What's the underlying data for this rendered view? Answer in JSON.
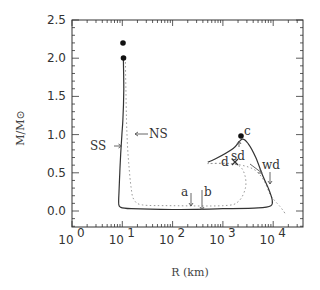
{
  "chart_data": {
    "type": "line",
    "title": "",
    "xlabel": "R (km)",
    "ylabel": "M/M⊙",
    "xscale": "log",
    "xlim": [
      1,
      40000
    ],
    "ylim": [
      -0.2,
      2.5
    ],
    "x_ticks": [
      {
        "value": 1,
        "base": "10",
        "exp": "0"
      },
      {
        "value": 10,
        "base": "10",
        "exp": "1"
      },
      {
        "value": 100,
        "base": "10",
        "exp": "2"
      },
      {
        "value": 1000,
        "base": "10",
        "exp": "3"
      },
      {
        "value": 10000,
        "base": "10",
        "exp": "4"
      }
    ],
    "y_ticks": [
      "0.0",
      "0.5",
      "1.0",
      "1.5",
      "2.0",
      "2.5"
    ],
    "grid": false,
    "legend": null,
    "series": [
      {
        "name": "SS",
        "style": "solid",
        "points": [
          [
            10.5,
            2.0
          ],
          [
            10.7,
            1.6
          ],
          [
            10.3,
            1.2
          ],
          [
            9.8,
            1.0
          ],
          [
            9.3,
            0.75
          ],
          [
            8.9,
            0.5
          ],
          [
            8.6,
            0.25
          ],
          [
            8.5,
            0.1
          ],
          [
            9.2,
            0.05
          ],
          [
            15,
            0.03
          ],
          [
            100,
            0.02
          ],
          [
            1000,
            0.03
          ],
          [
            5000,
            0.04
          ],
          [
            9000,
            0.07
          ],
          [
            9500,
            0.15
          ],
          [
            8000,
            0.3
          ],
          [
            6300,
            0.45
          ],
          [
            4500,
            0.7
          ],
          [
            3200,
            0.88
          ],
          [
            2400,
            0.94
          ],
          [
            1600,
            0.82
          ],
          [
            700,
            0.68
          ],
          [
            500,
            0.64
          ]
        ]
      },
      {
        "name": "NS",
        "style": "dotted",
        "points": [
          [
            11.5,
            2.0
          ],
          [
            11.8,
            1.6
          ],
          [
            12.1,
            1.2
          ],
          [
            12.6,
            0.9
          ],
          [
            13.5,
            0.6
          ],
          [
            15,
            0.3
          ],
          [
            17,
            0.15
          ],
          [
            25,
            0.08
          ],
          [
            100,
            0.07
          ],
          [
            1000,
            0.07
          ],
          [
            2000,
            0.12
          ],
          [
            2800,
            0.3
          ],
          [
            2700,
            0.48
          ],
          [
            2000,
            0.6
          ],
          [
            1000,
            0.62
          ],
          [
            500,
            0.62
          ],
          [
            1500,
            0.62
          ],
          [
            4000,
            0.55
          ],
          [
            6500,
            0.4
          ],
          [
            9000,
            0.2
          ],
          [
            14000,
            0.05
          ],
          [
            18000,
            -0.05
          ]
        ]
      }
    ],
    "markers": [
      {
        "label": "",
        "R": 10.5,
        "M": 2.2,
        "shape": "filled-circle"
      },
      {
        "label": "",
        "R": 10.8,
        "M": 2.0,
        "shape": "filled-circle"
      },
      {
        "label": "c",
        "R": 2300,
        "M": 0.97,
        "shape": "filled-circle"
      },
      {
        "label": "d",
        "R": 500,
        "M": 0.64,
        "shape": "cross"
      }
    ],
    "annotations": [
      {
        "text": "SS",
        "points_to": "SS curve at M≈0.78",
        "arrow": "right"
      },
      {
        "text": "NS",
        "points_to": "NS curve at M≈1.0",
        "arrow": "left"
      },
      {
        "text": "a",
        "R": 300,
        "arrow": "down"
      },
      {
        "text": "b",
        "R": 450,
        "arrow": "down"
      },
      {
        "text": "c",
        "R": 2300,
        "M": 0.97
      },
      {
        "text": "d",
        "R": 500,
        "M": 0.64
      },
      {
        "text": "sd",
        "R": 2100,
        "arrow": "up"
      },
      {
        "text": "wd",
        "R": 9000,
        "arrow": "down"
      }
    ]
  },
  "labels": {
    "ylabel": "M/M⊙",
    "xlabel": "R (km)",
    "ss": "SS",
    "ns": "NS",
    "a": "a",
    "b": "b",
    "c": "c",
    "d": "d",
    "sd": "sd",
    "wd": "wd"
  }
}
